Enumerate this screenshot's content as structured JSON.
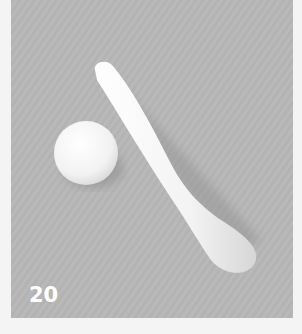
{
  "photo": {
    "description": "White clay ball and elongated club-shaped roll on gray textured surface",
    "background_color": "#b9b9b9",
    "object_color": "#f6f6f6",
    "step_number": "20"
  }
}
